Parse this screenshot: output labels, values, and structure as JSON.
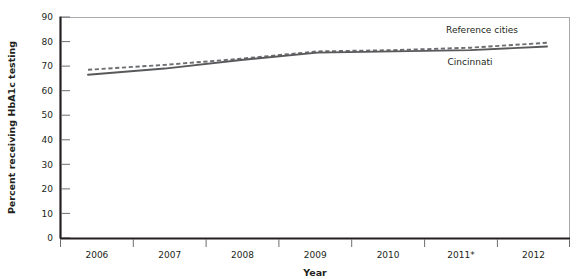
{
  "chart_data": {
    "type": "line",
    "title": "",
    "subtitle": "",
    "xlabel": "Year",
    "ylabel": "Percent receiving HbA1c testing",
    "categories": [
      "2006",
      "2007",
      "2008",
      "2009",
      "2010",
      "2011*",
      "2012"
    ],
    "x": [
      2006,
      2007,
      2008,
      2009,
      2010,
      2011,
      2012
    ],
    "xtick_labels": [
      "2006",
      "2007",
      "2008",
      "2009",
      "2010",
      "2011*",
      "2012"
    ],
    "ytick_labels": [
      "0",
      "10",
      "20",
      "30",
      "40",
      "50",
      "60",
      "70",
      "80",
      "90"
    ],
    "ytick_values": [
      0,
      10,
      20,
      30,
      40,
      50,
      60,
      70,
      80,
      90
    ],
    "ylim": [
      0,
      90
    ],
    "grid": false,
    "legend_position": "inline-annotation",
    "series": [
      {
        "name": "Reference cities",
        "style": "dashed",
        "color": "#6d6e71",
        "values": [
          68.5,
          70.5,
          73.0,
          76.0,
          76.5,
          77.5,
          79.5
        ]
      },
      {
        "name": "Cincinnati",
        "style": "solid",
        "color": "#58595b",
        "values": [
          66.5,
          69.0,
          72.5,
          75.5,
          76.0,
          76.5,
          78.0
        ]
      }
    ],
    "annotations": [
      {
        "text": "Reference cities",
        "series": "Reference cities"
      },
      {
        "text": "Cincinnati",
        "series": "Cincinnati"
      }
    ],
    "footnote_marker": "*"
  },
  "axes": {
    "y_title": "Percent receiving HbA1c testing",
    "x_title": "Year"
  },
  "colors": {
    "solid_series": "#58595b",
    "dashed_series": "#6d6e71",
    "axis": "#231f20",
    "frame": "#a7a9ac",
    "tick": "#6d6e71",
    "background": "#ffffff"
  }
}
